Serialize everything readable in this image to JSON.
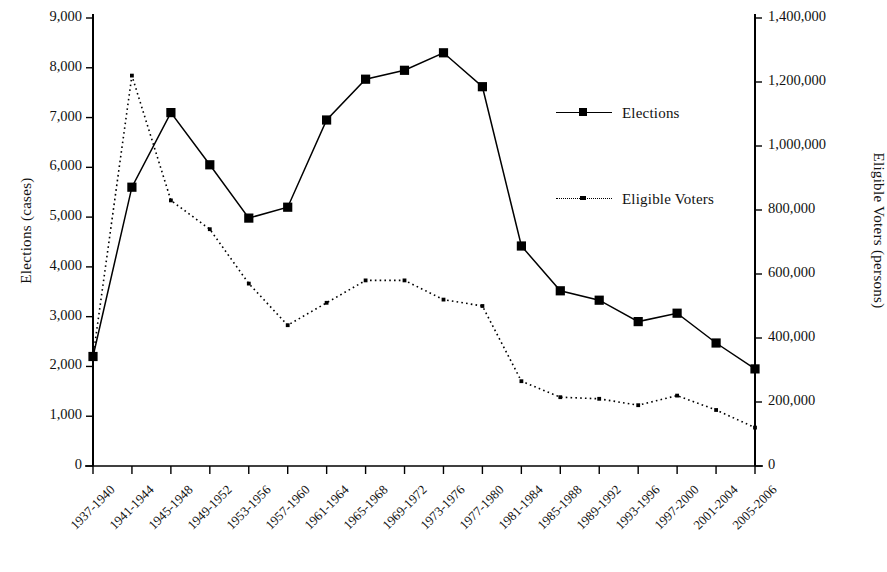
{
  "chart_data": {
    "type": "line",
    "title": "",
    "xlabel": "",
    "ylabel": "Elections (cases)",
    "y2label": "Eligible Voters (persons)",
    "grid": false,
    "legend_position": "center-right",
    "categories": [
      "1937-1940",
      "1941-1944",
      "1945-1948",
      "1949-1952",
      "1953-1956",
      "1957-1960",
      "1961-1964",
      "1965-1968",
      "1969-1972",
      "1973-1976",
      "1977-1980",
      "1981-1984",
      "1985-1988",
      "1989-1992",
      "1993-1996",
      "1997-2000",
      "2001-2004",
      "2005-2006"
    ],
    "ylim": [
      0,
      9000
    ],
    "y2lim": [
      0,
      1400000
    ],
    "yticks": [
      "0",
      "1,000",
      "2,000",
      "3,000",
      "4,000",
      "5,000",
      "6,000",
      "7,000",
      "8,000",
      "9,000"
    ],
    "ytick_values": [
      0,
      1000,
      2000,
      3000,
      4000,
      5000,
      6000,
      7000,
      8000,
      9000
    ],
    "y2ticks": [
      "0",
      "200,000",
      "400,000",
      "600,000",
      "800,000",
      "1,000,000",
      "1,200,000",
      "1,400,000"
    ],
    "y2tick_values": [
      0,
      200000,
      400000,
      600000,
      800000,
      1000000,
      1200000,
      1400000
    ],
    "series": [
      {
        "name": "Elections",
        "axis": "left",
        "style": "solid",
        "marker": "square",
        "color": "#000000",
        "values": [
          2200,
          5600,
          7100,
          6050,
          4980,
          5200,
          6950,
          7770,
          7950,
          8300,
          7620,
          4420,
          3520,
          3330,
          2900,
          3070,
          2470,
          1950
        ]
      },
      {
        "name": "Eligible Voters",
        "axis": "right",
        "style": "dotted",
        "marker": "small-square",
        "color": "#000000",
        "values": [
          340000,
          1220000,
          830000,
          740000,
          570000,
          440000,
          510000,
          580000,
          580000,
          520000,
          500000,
          265000,
          215000,
          210000,
          190000,
          220000,
          175000,
          120000
        ]
      }
    ]
  },
  "legend": {
    "items": [
      {
        "label": "Elections",
        "style": "solid"
      },
      {
        "label": "Eligible Voters",
        "style": "dotted"
      }
    ]
  }
}
